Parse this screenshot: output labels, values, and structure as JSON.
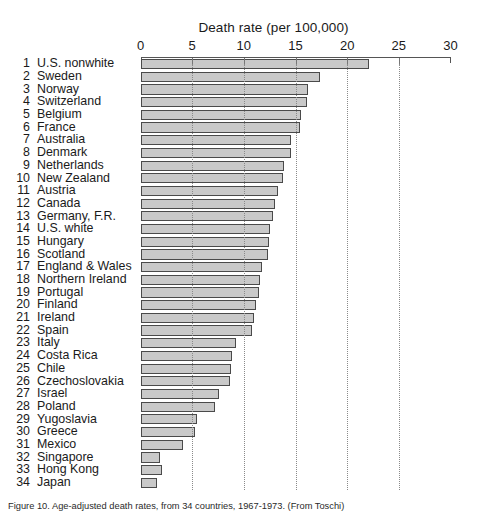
{
  "chart_data": {
    "type": "bar",
    "orientation": "horizontal",
    "title": "Death rate (per 100,000)",
    "xlabel": "Death rate (per 100,000)",
    "ylabel": "",
    "xlim": [
      0,
      30
    ],
    "xticks": [
      0,
      5,
      10,
      15,
      20,
      25,
      30
    ],
    "xtick_labels": [
      "0",
      "5",
      "10",
      "15",
      "20",
      "25",
      "30"
    ],
    "grid": "dotted vertical gridlines at 5, 10, 15, 20, 25",
    "legend": "none",
    "bar_fill_color": "#c9c9c9",
    "bar_border_color": "#4a4a4a",
    "axis_color": "#555555",
    "categories": [
      "U.S. nonwhite",
      "Sweden",
      "Norway",
      "Switzerland",
      "Belgium",
      "France",
      "Australia",
      "Denmark",
      "Netherlands",
      "New Zealand",
      "Austria",
      "Canada",
      "Germany, F.R.",
      "U.S. white",
      "Hungary",
      "Scotland",
      "England & Wales",
      "Northern Ireland",
      "Portugal",
      "Finland",
      "Ireland",
      "Spain",
      "Italy",
      "Costa Rica",
      "Chile",
      "Czechoslovakia",
      "Israel",
      "Poland",
      "Yugoslavia",
      "Greece",
      "Mexico",
      "Singapore",
      "Hong Kong",
      "Japan"
    ],
    "ranks": [
      1,
      2,
      3,
      4,
      5,
      6,
      7,
      8,
      9,
      10,
      11,
      12,
      13,
      14,
      15,
      16,
      17,
      18,
      19,
      20,
      21,
      22,
      23,
      24,
      25,
      26,
      27,
      28,
      29,
      30,
      31,
      32,
      33,
      34
    ],
    "values": [
      22.1,
      17.4,
      16.2,
      16.1,
      15.5,
      15.4,
      14.6,
      14.6,
      13.9,
      13.8,
      13.3,
      13.0,
      12.8,
      12.5,
      12.4,
      12.3,
      11.8,
      11.6,
      11.5,
      11.2,
      11.0,
      10.8,
      9.2,
      8.9,
      8.8,
      8.7,
      7.6,
      7.2,
      5.5,
      5.3,
      4.1,
      1.9,
      2.1,
      1.6
    ]
  },
  "caption": {
    "text": "Figure 10. Age-adjusted death rates, from 34 countries, 1967-1973. (From Toschi)"
  }
}
